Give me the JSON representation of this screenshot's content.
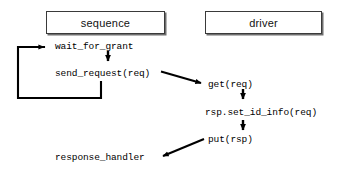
{
  "diagram": {
    "stroke_color": "#000000",
    "box_border_color": "#3a3a3a",
    "box_shadow_color": "#6e6e6e",
    "background": "#ffffff",
    "lanes": [
      {
        "id": "sequence",
        "label": "sequence"
      },
      {
        "id": "driver",
        "label": "driver"
      }
    ],
    "steps": {
      "wait_for_grant": "wait_for_grant",
      "send_request": "send_request(req)",
      "get": "get(req)",
      "set_id_info": "rsp.set_id_info(req)",
      "put": "put(rsp)",
      "response_handler": "response_handler"
    }
  }
}
